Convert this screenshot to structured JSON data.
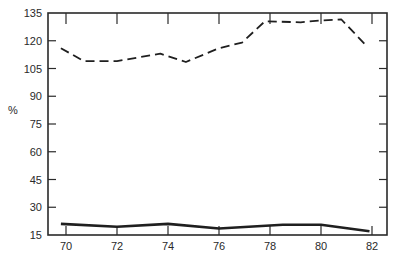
{
  "chart_data": {
    "type": "line",
    "title": "",
    "xlabel": "",
    "ylabel": "%",
    "xlim": [
      69.8,
      82.6
    ],
    "ylim": [
      15,
      135
    ],
    "x_ticks": [
      70,
      72,
      74,
      76,
      78,
      80,
      82
    ],
    "y_ticks": [
      15,
      30,
      45,
      60,
      75,
      90,
      105,
      120,
      135
    ],
    "grid": false,
    "legend": null,
    "series": [
      {
        "name": "upper series",
        "style": "dashed",
        "x": [
          69.8,
          70.7,
          72.0,
          73.7,
          74.7,
          76.0,
          76.9,
          77.8,
          79.2,
          80.0,
          80.8,
          81.8
        ],
        "values": [
          116,
          109,
          109,
          113,
          108.5,
          116,
          119,
          130.5,
          130,
          131,
          131.5,
          117
        ]
      },
      {
        "name": "lower series",
        "style": "solid",
        "x": [
          69.8,
          72.0,
          74.0,
          76.0,
          78.5,
          80.0,
          81.9
        ],
        "values": [
          21,
          19.5,
          21,
          18.5,
          20.5,
          20.5,
          17
        ]
      }
    ]
  },
  "axes": {
    "y_label": "%",
    "x_tick_labels": [
      "70",
      "72",
      "74",
      "76",
      "78",
      "80",
      "82"
    ],
    "y_tick_labels": [
      "15",
      "30",
      "45",
      "60",
      "75",
      "90",
      "105",
      "120",
      "135"
    ]
  },
  "colors": {
    "line": "#1f1f1f",
    "axis": "#2a2a2a",
    "background": "#ffffff"
  }
}
